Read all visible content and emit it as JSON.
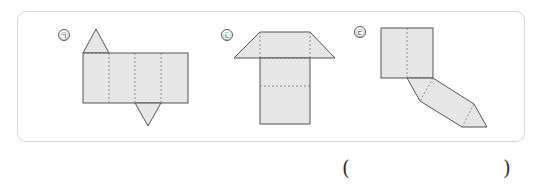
{
  "figures": [
    {
      "label": "㉠",
      "description": "triangular prism net, top triangle left, bottom triangle right"
    },
    {
      "label": "㉡",
      "description": "net with trapezoid top"
    },
    {
      "label": "㉢",
      "description": "bent net with triangle end"
    }
  ],
  "answer": {
    "open": "(",
    "close": ")",
    "value": ""
  },
  "colors": {
    "fill": "#e6e6e6",
    "stroke": "#555555",
    "panel_border": "#d6d6d6"
  }
}
